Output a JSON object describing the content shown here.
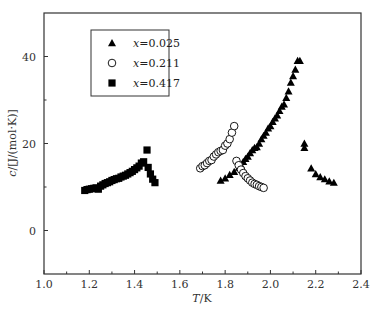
{
  "chart_data": {
    "type": "scatter",
    "title": "",
    "xlabel": "T/K",
    "ylabel": "c/[J/(mol·K)]",
    "xlim": [
      1.0,
      2.4
    ],
    "ylim": [
      -10,
      50
    ],
    "xticks": [
      1.0,
      1.2,
      1.4,
      1.6,
      1.8,
      2.0,
      2.2,
      2.4
    ],
    "xtick_labels": [
      "1.0",
      "1.2",
      "1.4",
      "1.6",
      "1.8",
      "2.0",
      "2.2",
      "2.4"
    ],
    "yticks": [
      0,
      20,
      40
    ],
    "ytick_labels": [
      "0",
      "20",
      "40"
    ],
    "grid": false,
    "legend_position": "upper left",
    "series": [
      {
        "name": "x=0.025",
        "marker": "triangle-filled",
        "x": [
          1.78,
          1.8,
          1.82,
          1.84,
          1.86,
          1.87,
          1.88,
          1.89,
          1.9,
          1.91,
          1.92,
          1.93,
          1.94,
          1.95,
          1.96,
          1.97,
          1.98,
          1.99,
          2.0,
          2.01,
          2.02,
          2.03,
          2.04,
          2.05,
          2.06,
          2.07,
          2.08,
          2.09,
          2.1,
          2.11,
          2.12,
          2.13,
          2.15,
          2.15,
          2.18,
          2.2,
          2.22,
          2.24,
          2.26,
          2.28
        ],
        "y": [
          11.5,
          12.0,
          12.8,
          13.5,
          14.5,
          15.0,
          15.8,
          16.5,
          17.0,
          17.8,
          18.5,
          19.0,
          19.2,
          20.0,
          21.0,
          21.8,
          22.5,
          23.5,
          24.0,
          25.0,
          25.8,
          26.5,
          27.5,
          28.5,
          29.0,
          30.5,
          32.0,
          34.0,
          35.5,
          37.0,
          39.0,
          39.0,
          20.0,
          19.0,
          14.3,
          13.0,
          12.3,
          11.8,
          11.3,
          11.0
        ]
      },
      {
        "name": "x=0.211",
        "marker": "circle-open",
        "x": [
          1.69,
          1.7,
          1.71,
          1.72,
          1.73,
          1.74,
          1.75,
          1.76,
          1.77,
          1.78,
          1.79,
          1.8,
          1.81,
          1.82,
          1.83,
          1.84,
          1.85,
          1.86,
          1.87,
          1.88,
          1.89,
          1.9,
          1.91,
          1.92,
          1.93,
          1.94,
          1.95,
          1.96,
          1.97
        ],
        "y": [
          14.3,
          14.8,
          15.0,
          15.5,
          16.0,
          16.2,
          17.0,
          17.5,
          18.0,
          18.3,
          18.5,
          19.5,
          20.0,
          21.0,
          22.5,
          24.0,
          16.0,
          15.0,
          14.0,
          13.2,
          12.5,
          12.0,
          11.5,
          11.0,
          10.7,
          10.5,
          10.2,
          10.0,
          9.8
        ]
      },
      {
        "name": "x=0.417",
        "marker": "square-filled",
        "x": [
          1.18,
          1.19,
          1.2,
          1.21,
          1.22,
          1.23,
          1.24,
          1.25,
          1.26,
          1.27,
          1.28,
          1.29,
          1.3,
          1.31,
          1.32,
          1.33,
          1.34,
          1.35,
          1.36,
          1.37,
          1.38,
          1.39,
          1.4,
          1.41,
          1.42,
          1.43,
          1.44,
          1.455,
          1.46,
          1.47,
          1.48,
          1.49
        ],
        "y": [
          9.2,
          9.4,
          9.5,
          9.6,
          9.7,
          9.8,
          9.5,
          10.2,
          10.5,
          10.8,
          11.0,
          11.2,
          11.5,
          11.7,
          11.9,
          12.0,
          12.3,
          12.5,
          12.7,
          13.0,
          13.3,
          13.6,
          14.0,
          14.4,
          14.8,
          15.5,
          15.8,
          18.5,
          14.5,
          13.0,
          11.8,
          11.0
        ]
      }
    ]
  },
  "legend": {
    "items": [
      {
        "label": "x=0.025",
        "prefix": "x",
        "value": "=0.025",
        "marker": "triangle-filled"
      },
      {
        "label": "x=0.211",
        "prefix": "x",
        "value": "=0.211",
        "marker": "circle-open"
      },
      {
        "label": "x=0.417",
        "prefix": "x",
        "value": "=0.417",
        "marker": "square-filled"
      }
    ]
  },
  "axes": {
    "x_label_var": "T",
    "x_label_unit": "/K",
    "y_label_var": "c",
    "y_label_unit": "/[J/(mol·K)]"
  },
  "colors": {
    "axis": "#333333",
    "marker": "#000000",
    "background": "#ffffff"
  }
}
